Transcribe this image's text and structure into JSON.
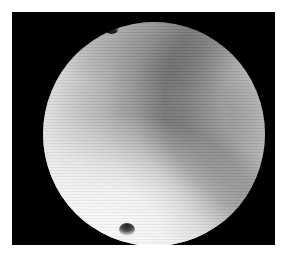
{
  "page": {
    "background_color": "#ffffff",
    "width": 283,
    "height": 256
  },
  "image_panel": {
    "name": "astronomical-image-frame",
    "background_color": "#000000",
    "left": 12,
    "top": 12,
    "width": 263,
    "height": 233,
    "caption": "",
    "label": ""
  },
  "subject": {
    "type": "planetary-disk",
    "description": "Grayscale telescopic image of a featureless gas-giant disk against black sky",
    "center_x": 153,
    "center_y": 129,
    "diameter_px": 222,
    "colors": {
      "sky_background": "#000000",
      "disk_mid": "#bcbcbc",
      "disk_dark_band": "#a2a2a2",
      "disk_limb_bright": "#e2e2e2",
      "polar_cap_bright": "#ffffff",
      "limb_edge": "#2a2a2a"
    },
    "features": [
      {
        "name": "south-polar-bright-cap",
        "position": "lower-left",
        "relative_brightness": "brightest"
      },
      {
        "name": "central-dark-band",
        "position": "center, right of centre",
        "relative_brightness": "darkest interior"
      },
      {
        "name": "bright-limb-ring",
        "position": "upper-right and right limb",
        "relative_brightness": "bright"
      },
      {
        "name": "limb-notch-north",
        "position": "north limb, left of top",
        "relative_brightness": "dark"
      },
      {
        "name": "limb-notch-south",
        "position": "south limb, left of bottom",
        "relative_brightness": "dark"
      }
    ]
  },
  "annotations": {
    "title": "",
    "axis_labels": [],
    "scale_bar": "",
    "tick_labels": []
  }
}
